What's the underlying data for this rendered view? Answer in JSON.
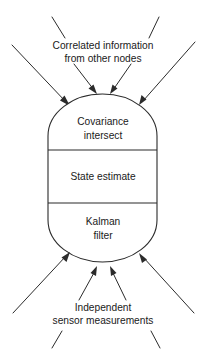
{
  "diagram": {
    "background_color": "#ffffff",
    "line_color": "#2b2b2b",
    "text_color": "#1a1a1a",
    "top_label": {
      "line1": "Correlated information",
      "line2": "from other nodes"
    },
    "bottom_label": {
      "line1": "Independent",
      "line2": "sensor measurements"
    },
    "node": {
      "sections": [
        {
          "id": "covariance-intersect",
          "line1": "Covariance",
          "line2": "intersect"
        },
        {
          "id": "state-estimate",
          "line1": "State estimate",
          "line2": ""
        },
        {
          "id": "kalman-filter",
          "line1": "Kalman",
          "line2": "filter"
        }
      ]
    },
    "top_arrows_count": 4,
    "bottom_arrows_count": 4,
    "top_stub_lines_count": 2,
    "bottom_stub_lines_count": 2
  }
}
